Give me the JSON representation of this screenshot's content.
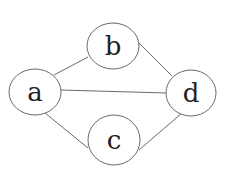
{
  "diagram": {
    "type": "undirected-graph",
    "width": 225,
    "height": 185,
    "background": "#ffffff",
    "stroke_color": "#6a6a6a",
    "label_color": "#222222",
    "nodes": [
      {
        "id": "a",
        "label": "a",
        "cx": 35,
        "cy": 92,
        "rx": 26,
        "ry": 23
      },
      {
        "id": "b",
        "label": "b",
        "cx": 113,
        "cy": 46,
        "rx": 26,
        "ry": 23
      },
      {
        "id": "c",
        "label": "c",
        "cx": 114,
        "cy": 140,
        "rx": 26,
        "ry": 25
      },
      {
        "id": "d",
        "label": "d",
        "cx": 191,
        "cy": 93,
        "rx": 25,
        "ry": 23
      }
    ],
    "edges": [
      {
        "from": "a",
        "to": "b",
        "x1": 54,
        "y1": 75,
        "x2": 88,
        "y2": 57
      },
      {
        "from": "a",
        "to": "d",
        "x1": 61,
        "y1": 90,
        "x2": 166,
        "y2": 93
      },
      {
        "from": "b",
        "to": "d",
        "x1": 138,
        "y1": 42,
        "x2": 172,
        "y2": 76
      },
      {
        "from": "a",
        "to": "c",
        "x1": 45,
        "y1": 113,
        "x2": 88,
        "y2": 148
      },
      {
        "from": "c",
        "to": "d",
        "x1": 139,
        "y1": 150,
        "x2": 182,
        "y2": 113
      }
    ]
  }
}
